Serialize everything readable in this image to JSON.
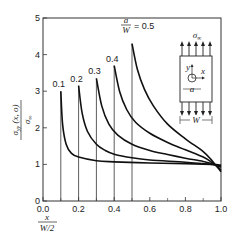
{
  "chart_data": {
    "type": "line",
    "title": "",
    "xlabel": "x / (W/2)",
    "ylabel": "σyy(x, o) / σ∞",
    "xlim": [
      0.0,
      1.0
    ],
    "ylim": [
      0,
      5
    ],
    "x_ticks": [
      "0.0",
      "0.2",
      "0.4",
      "0.6",
      "0.8",
      "1.0"
    ],
    "y_ticks": [
      "0",
      "1",
      "2",
      "3",
      "4",
      "5"
    ],
    "grid": false,
    "legend": "inline labels at curve tops",
    "annotation": "a/W = 0.5",
    "series": [
      {
        "name": "0.1",
        "x": [
          0.1,
          0.11,
          0.13,
          0.16,
          0.2,
          0.3,
          0.4,
          0.6,
          0.8,
          0.95,
          1.0
        ],
        "y": [
          3.0,
          2.1,
          1.55,
          1.3,
          1.2,
          1.1,
          1.07,
          1.04,
          1.02,
          1.0,
          0.98
        ]
      },
      {
        "name": "0.2",
        "x": [
          0.2,
          0.22,
          0.25,
          0.3,
          0.35,
          0.4,
          0.5,
          0.6,
          0.8,
          0.95,
          1.0
        ],
        "y": [
          3.15,
          2.4,
          1.9,
          1.55,
          1.38,
          1.28,
          1.18,
          1.12,
          1.06,
          1.0,
          0.95
        ]
      },
      {
        "name": "0.3",
        "x": [
          0.3,
          0.33,
          0.37,
          0.42,
          0.5,
          0.6,
          0.7,
          0.8,
          0.9,
          0.95,
          1.0
        ],
        "y": [
          3.35,
          2.6,
          2.1,
          1.8,
          1.55,
          1.38,
          1.27,
          1.17,
          1.08,
          1.02,
          0.92
        ]
      },
      {
        "name": "0.4",
        "x": [
          0.4,
          0.43,
          0.47,
          0.52,
          0.6,
          0.7,
          0.8,
          0.9,
          0.95,
          1.0
        ],
        "y": [
          3.7,
          3.0,
          2.5,
          2.15,
          1.85,
          1.6,
          1.4,
          1.2,
          1.05,
          0.85
        ]
      },
      {
        "name": "0.5",
        "x": [
          0.5,
          0.53,
          0.57,
          0.62,
          0.7,
          0.8,
          0.9,
          0.95,
          1.0
        ],
        "y": [
          4.3,
          3.6,
          3.05,
          2.6,
          2.1,
          1.7,
          1.35,
          1.1,
          0.8
        ]
      }
    ],
    "inset": {
      "load_label": "σ∞",
      "axis_labels": [
        "y",
        "x"
      ],
      "hole_label": "a",
      "width_label": "W"
    }
  }
}
